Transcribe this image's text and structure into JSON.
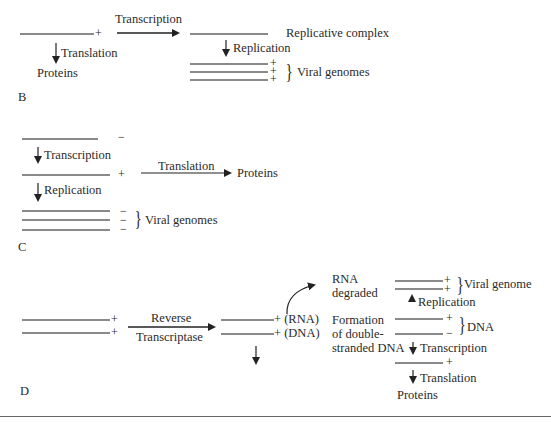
{
  "panels": {
    "B": {
      "label": "B",
      "strand_sign": "+",
      "transcription": "Transcription",
      "translation": "Translation",
      "proteins": "Proteins",
      "replicative_complex": "Replicative complex",
      "replication": "Replication",
      "genome_signs": [
        "+",
        "+",
        "+"
      ],
      "viral_genomes": "Viral genomes"
    },
    "C": {
      "label": "C",
      "strand_sign_top": "−",
      "transcription": "Transcription",
      "strand_sign_mid": "+",
      "translation": "Translation",
      "proteins": "Proteins",
      "replication": "Replication",
      "genome_signs": [
        "−",
        "−",
        "−"
      ],
      "viral_genomes": "Viral genomes"
    },
    "D": {
      "label": "D",
      "input_signs": [
        "+",
        "+"
      ],
      "reverse": "Reverse",
      "transcriptase": "Transcriptase",
      "hybrid_rna": "+ (RNA)",
      "hybrid_dna": "+ (DNA)",
      "rna_degraded_1": "RNA",
      "rna_degraded_2": "degraded",
      "formation_1": "Formation",
      "formation_2": "of double-",
      "formation_3": "stranded DNA",
      "viral_genome_signs": [
        "+",
        "+"
      ],
      "viral_genome": "Viral genome",
      "replication": "Replication",
      "dna_signs": [
        "+",
        "−"
      ],
      "dna": "DNA",
      "transcription": "Transcription",
      "mrna_sign": "+",
      "translation": "Translation",
      "proteins": "Proteins"
    }
  }
}
